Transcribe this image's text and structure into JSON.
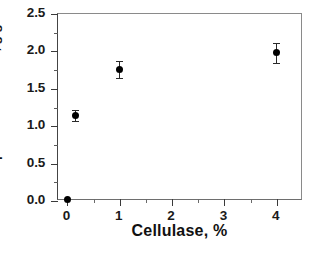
{
  "chart_data": {
    "type": "scatter",
    "title": "",
    "xlabel": "Cellulase, %",
    "ylabel": "Adsorption of cellulase, g/g PAA",
    "xlim": [
      -0.18,
      4.5
    ],
    "ylim": [
      0.0,
      2.5
    ],
    "grid": false,
    "legend": null,
    "x_ticks": [
      "0",
      "1",
      "2",
      "3",
      "4"
    ],
    "x_tick_values": [
      0,
      1,
      2,
      3,
      4
    ],
    "x_minor_tick_values": [
      0.5,
      1.5,
      2.5,
      3.5
    ],
    "y_ticks": [
      "0.0",
      "0.5",
      "1.0",
      "1.5",
      "2.0",
      "2.5"
    ],
    "y_tick_values": [
      0.0,
      0.5,
      1.0,
      1.5,
      2.0,
      2.5
    ],
    "y_minor_tick_values": [
      0.25,
      0.75,
      1.25,
      1.75,
      2.25
    ],
    "marker": "filled-circle",
    "marker_color": "#000000",
    "series": [
      {
        "name": "Adsorption of cellulase",
        "points": [
          {
            "x": 0.0,
            "y": 0.02,
            "yerr": 0.0
          },
          {
            "x": 0.16,
            "y": 1.14,
            "yerr": 0.07
          },
          {
            "x": 1.0,
            "y": 1.76,
            "yerr": 0.11
          },
          {
            "x": 4.0,
            "y": 1.98,
            "yerr": 0.13
          }
        ]
      }
    ]
  },
  "figure": {
    "background_color": "#ffffff",
    "axis_color": "#3a3a3a"
  }
}
